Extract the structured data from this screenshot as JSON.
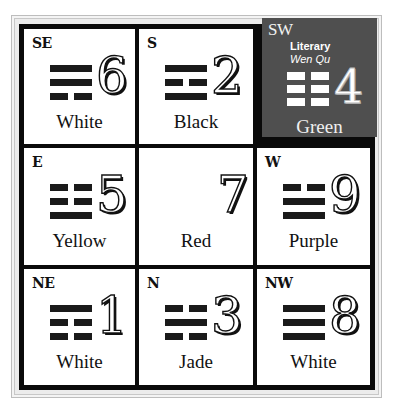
{
  "grid": {
    "cells": [
      {
        "id": "se",
        "direction": "SE",
        "number": "6",
        "color": "White",
        "trigram": [
          "solid",
          "solid",
          "broken"
        ]
      },
      {
        "id": "s",
        "direction": "S",
        "number": "2",
        "color": "Black",
        "trigram": [
          "solid",
          "broken",
          "solid"
        ]
      },
      {
        "id": "sw",
        "direction": "SW",
        "number": "4",
        "color": "Green",
        "trigram": [
          "broken",
          "broken",
          "broken"
        ],
        "star_name": "Literary",
        "star_alias": "Wen Qu",
        "highlighted": true,
        "highlight_color": "#4f4f4f"
      },
      {
        "id": "e",
        "direction": "E",
        "number": "5",
        "color": "Yellow",
        "trigram": [
          "broken",
          "broken",
          "solid"
        ]
      },
      {
        "id": "center",
        "direction": "",
        "number": "7",
        "color": "Red",
        "trigram": []
      },
      {
        "id": "w",
        "direction": "W",
        "number": "9",
        "color": "Purple",
        "trigram": [
          "broken",
          "solid",
          "solid"
        ]
      },
      {
        "id": "ne",
        "direction": "NE",
        "number": "1",
        "color": "White",
        "trigram": [
          "solid",
          "broken",
          "broken"
        ]
      },
      {
        "id": "n",
        "direction": "N",
        "number": "3",
        "color": "Jade",
        "trigram": [
          "broken",
          "solid",
          "broken"
        ]
      },
      {
        "id": "nw",
        "direction": "NW",
        "number": "8",
        "color": "White",
        "trigram": [
          "solid",
          "solid",
          "solid"
        ]
      }
    ]
  }
}
